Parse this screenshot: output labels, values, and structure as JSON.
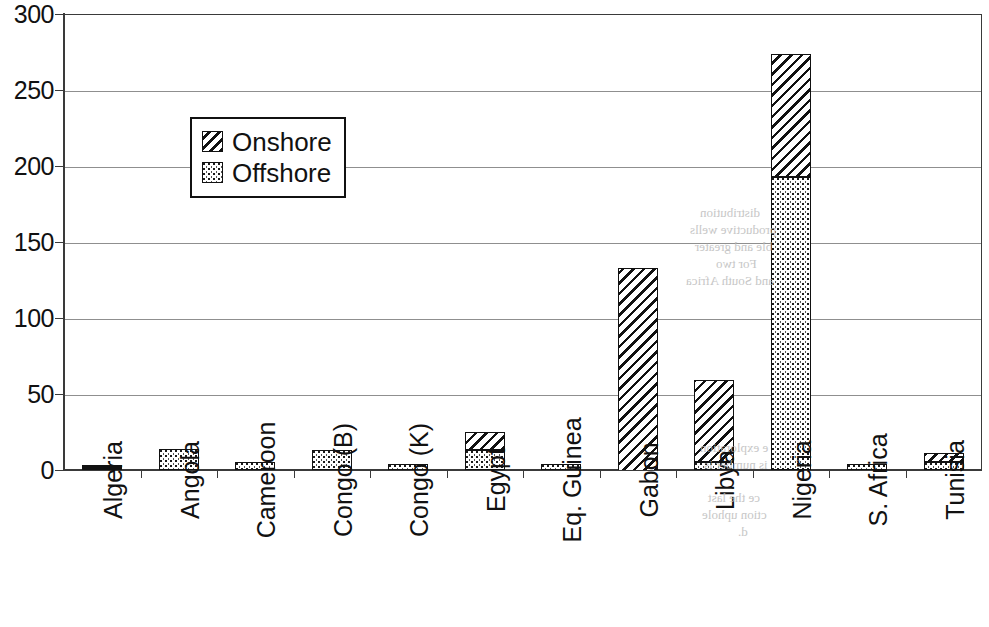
{
  "chart_data": {
    "type": "bar",
    "title": "",
    "xlabel": "",
    "ylabel": "",
    "ylim": [
      0,
      300
    ],
    "yticks": [
      0,
      50,
      100,
      150,
      200,
      250,
      300
    ],
    "grid": true,
    "stacked": true,
    "legend_position": "inside-upper-left",
    "categories": [
      "Algeria",
      "Angola",
      "Cameroon",
      "Congo (B)",
      "Congo (K)",
      "Egypt",
      "Eq. Guinea",
      "Gabon",
      "Libya",
      "Nigeria",
      "S. Africa",
      "Tunisia"
    ],
    "series": [
      {
        "name": "Offshore",
        "pattern": "dotted",
        "values": [
          1,
          14,
          5,
          13,
          3,
          13,
          3,
          0,
          5,
          193,
          3,
          5
        ]
      },
      {
        "name": "Onshore",
        "pattern": "diagonal-hatch",
        "values": [
          0,
          0,
          0,
          0,
          0,
          12,
          0,
          133,
          54,
          81,
          0,
          6
        ]
      }
    ],
    "totals": [
      1,
      14,
      5,
      13,
      3,
      25,
      3,
      133,
      59,
      274,
      3,
      11
    ]
  },
  "legend": {
    "entries": [
      {
        "label": "Onshore"
      },
      {
        "label": "Offshore"
      }
    ]
  },
  "axis": {
    "y_tick_labels": [
      "300",
      "250",
      "200",
      "150",
      "100",
      "50",
      "0"
    ]
  },
  "artifacts": {
    "bleed_lines": [
      {
        "text": "distribution",
        "x": 700,
        "y": 205
      },
      {
        "text": "productive wells",
        "x": 690,
        "y": 222
      },
      {
        "text": "ble and greater",
        "x": 695,
        "y": 239
      },
      {
        "text": "For two",
        "x": 716,
        "y": 256
      },
      {
        "text": "and South Africa",
        "x": 686,
        "y": 273
      },
      {
        "text": "e exploration",
        "x": 700,
        "y": 440
      },
      {
        "text": "is number is",
        "x": 704,
        "y": 457
      },
      {
        "text": "ce the last",
        "x": 708,
        "y": 490
      },
      {
        "text": "ction uphole",
        "x": 702,
        "y": 507
      },
      {
        "text": "d.",
        "x": 738,
        "y": 524
      }
    ]
  }
}
